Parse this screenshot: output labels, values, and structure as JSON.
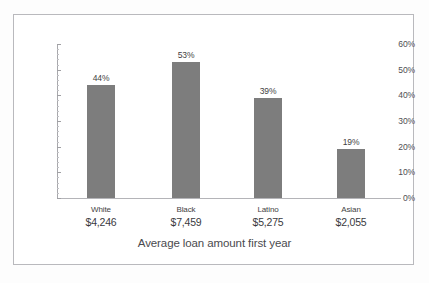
{
  "chart_data": {
    "type": "bar",
    "title": "",
    "xlabel": "Average loan amount first year",
    "ylabel": "",
    "categories": [
      "White",
      "Black",
      "Latino",
      "Asian"
    ],
    "values": [
      44,
      53,
      39,
      19
    ],
    "value_labels": [
      "44%",
      "53%",
      "39%",
      "19%"
    ],
    "category_sublabels": [
      "$4,246",
      "$7,459",
      "$5,275",
      "$2,055"
    ],
    "ylim": [
      0,
      60
    ],
    "ytick_labels": [
      "60%",
      "50%",
      "40%",
      "30%",
      "20%",
      "10%",
      "0%"
    ],
    "ytick_values": [
      60,
      50,
      40,
      30,
      20,
      10,
      0
    ],
    "grid": false,
    "legend": null,
    "bar_color": "#7d7d7d",
    "axis_color": "#a8a8ac",
    "text_color": "#3f3f43",
    "frame_border_color": "#b9b9bd",
    "background_color": "#ffffff"
  }
}
